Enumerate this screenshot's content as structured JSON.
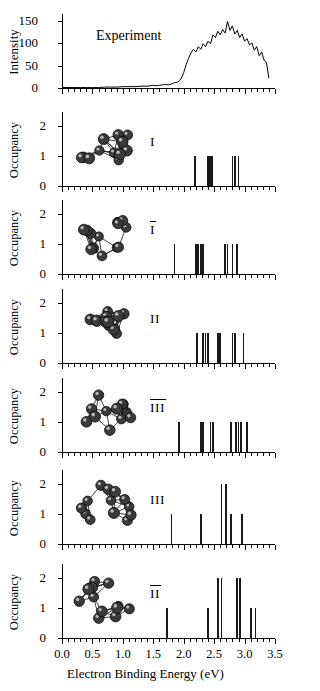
{
  "figure": {
    "xaxis": {
      "title": "Electron Binding Energy (eV)",
      "ticklabels": [
        "0.0",
        "0.5",
        "1.0",
        "1.5",
        "2.0",
        "2.5",
        "3.0",
        "3.5"
      ],
      "tickvalues": [
        0.0,
        0.5,
        1.0,
        1.5,
        2.0,
        2.5,
        3.0,
        3.5
      ],
      "min": 0.0,
      "max": 3.5,
      "minor_tick_step": 0.1
    },
    "ink_color": "#000000"
  },
  "chart_data": [
    {
      "type": "line",
      "panel_index": 0,
      "panel_label": "Experiment",
      "title": "Experiment",
      "xlabel": "Electron Binding Energy (eV)",
      "ylabel": "Intensity",
      "xlim": [
        0.0,
        3.5
      ],
      "ylim": [
        0,
        160
      ],
      "ytick_labels": [
        "0",
        "50",
        "100",
        "150"
      ],
      "ytick_values": [
        0,
        50,
        100,
        150
      ],
      "grid": false,
      "legend": "none",
      "x": [
        0.0,
        0.1,
        0.2,
        0.3,
        0.4,
        0.5,
        0.6,
        0.7,
        0.8,
        0.9,
        1.0,
        1.1,
        1.2,
        1.3,
        1.4,
        1.45,
        1.5,
        1.55,
        1.6,
        1.65,
        1.7,
        1.75,
        1.8,
        1.85,
        1.9,
        1.93,
        1.96,
        2.0,
        2.04,
        2.08,
        2.12,
        2.16,
        2.2,
        2.24,
        2.28,
        2.32,
        2.36,
        2.4,
        2.44,
        2.48,
        2.52,
        2.56,
        2.6,
        2.64,
        2.68,
        2.72,
        2.76,
        2.8,
        2.84,
        2.88,
        2.92,
        2.96,
        3.0,
        3.04,
        3.08,
        3.12,
        3.16,
        3.2,
        3.24,
        3.28,
        3.32,
        3.36,
        3.4
      ],
      "y": [
        1,
        1,
        1,
        1,
        1,
        1,
        1,
        2,
        2,
        2,
        3,
        3,
        3,
        4,
        4,
        5,
        6,
        5,
        6,
        7,
        8,
        7,
        9,
        12,
        13,
        16,
        22,
        34,
        52,
        66,
        78,
        86,
        80,
        92,
        86,
        98,
        92,
        104,
        98,
        118,
        112,
        126,
        118,
        130,
        122,
        148,
        128,
        138,
        120,
        128,
        112,
        120,
        104,
        110,
        96,
        100,
        84,
        92,
        72,
        80,
        62,
        56,
        22
      ]
    },
    {
      "type": "bar",
      "panel_index": 1,
      "panel_label": "I",
      "panel_label_overbar": false,
      "ylabel": "Occupancy",
      "xlabel": "",
      "xlim": [
        0.0,
        3.5
      ],
      "ylim": [
        0,
        2.4
      ],
      "ytick_labels": [
        "0",
        "1",
        "2"
      ],
      "ytick_values": [
        0,
        1,
        2
      ],
      "grid": false,
      "x": [
        2.18,
        2.4,
        2.43,
        2.46,
        2.8,
        2.84,
        2.9
      ],
      "values": [
        1.0,
        1.0,
        1.0,
        1.0,
        1.0,
        1.0,
        1.0
      ]
    },
    {
      "type": "bar",
      "panel_index": 2,
      "panel_label": "I",
      "panel_label_overbar": true,
      "ylabel": "Occupancy",
      "xlabel": "",
      "xlim": [
        0.0,
        3.5
      ],
      "ylim": [
        0,
        2.4
      ],
      "ytick_labels": [
        "0",
        "1",
        "2"
      ],
      "ytick_values": [
        0,
        1,
        2
      ],
      "grid": false,
      "x": [
        1.85,
        2.2,
        2.24,
        2.28,
        2.32,
        2.68,
        2.72,
        2.8,
        2.88
      ],
      "values": [
        1.0,
        1.0,
        1.0,
        1.0,
        1.0,
        1.0,
        1.0,
        1.0,
        1.0
      ]
    },
    {
      "type": "bar",
      "panel_index": 3,
      "panel_label": "II",
      "panel_label_overbar": false,
      "ylabel": "Occupancy",
      "xlabel": "",
      "xlim": [
        0.0,
        3.5
      ],
      "ylim": [
        0,
        2.4
      ],
      "ytick_labels": [
        "0",
        "1",
        "2"
      ],
      "ytick_values": [
        0,
        1,
        2
      ],
      "grid": false,
      "x": [
        2.22,
        2.32,
        2.36,
        2.4,
        2.56,
        2.6,
        2.8,
        2.84,
        2.98
      ],
      "values": [
        1.0,
        1.0,
        1.0,
        1.0,
        1.0,
        1.0,
        1.0,
        1.0,
        1.0
      ]
    },
    {
      "type": "bar",
      "panel_index": 4,
      "panel_label": "III",
      "panel_label_overbar": true,
      "ylabel": "Occupancy",
      "xlabel": "",
      "xlim": [
        0.0,
        3.5
      ],
      "ylim": [
        0,
        2.4
      ],
      "ytick_labels": [
        "0",
        "1",
        "2"
      ],
      "ytick_values": [
        0,
        1,
        2
      ],
      "grid": false,
      "x": [
        1.92,
        2.28,
        2.32,
        2.44,
        2.48,
        2.78,
        2.86,
        2.9,
        2.94,
        3.04
      ],
      "values": [
        1.0,
        1.0,
        1.0,
        1.0,
        1.0,
        1.0,
        1.0,
        1.0,
        1.0,
        1.0
      ]
    },
    {
      "type": "bar",
      "panel_index": 5,
      "panel_label": "III",
      "panel_label_overbar": false,
      "ylabel": "Occupancy",
      "xlabel": "",
      "xlim": [
        0.0,
        3.5
      ],
      "ylim": [
        0,
        2.4
      ],
      "ytick_labels": [
        "0",
        "1",
        "2"
      ],
      "ytick_values": [
        0,
        1,
        2
      ],
      "grid": false,
      "x": [
        1.8,
        2.28,
        2.62,
        2.7,
        2.78,
        2.96
      ],
      "values": [
        1.0,
        1.0,
        2.0,
        2.0,
        1.0,
        1.0
      ]
    },
    {
      "type": "bar",
      "panel_index": 6,
      "panel_label": "II",
      "panel_label_overbar": true,
      "ylabel": "Occupancy",
      "xlabel": "Electron Binding Energy (eV)",
      "xlim": [
        0.0,
        3.5
      ],
      "ylim": [
        0,
        2.4
      ],
      "ytick_labels": [
        "0",
        "1",
        "2"
      ],
      "ytick_values": [
        0,
        1,
        2
      ],
      "grid": false,
      "x": [
        1.72,
        2.4,
        2.56,
        2.62,
        2.88,
        2.92,
        3.1,
        3.18
      ],
      "values": [
        1.0,
        1.0,
        2.0,
        2.0,
        2.0,
        2.0,
        1.0,
        1.0
      ]
    }
  ],
  "cluster_structures": [
    {
      "panel_index": 1,
      "name": "cluster-structure-I"
    },
    {
      "panel_index": 2,
      "name": "cluster-structure-I-bar"
    },
    {
      "panel_index": 3,
      "name": "cluster-structure-II"
    },
    {
      "panel_index": 4,
      "name": "cluster-structure-III-bar"
    },
    {
      "panel_index": 5,
      "name": "cluster-structure-III"
    },
    {
      "panel_index": 6,
      "name": "cluster-structure-II-bar"
    }
  ]
}
